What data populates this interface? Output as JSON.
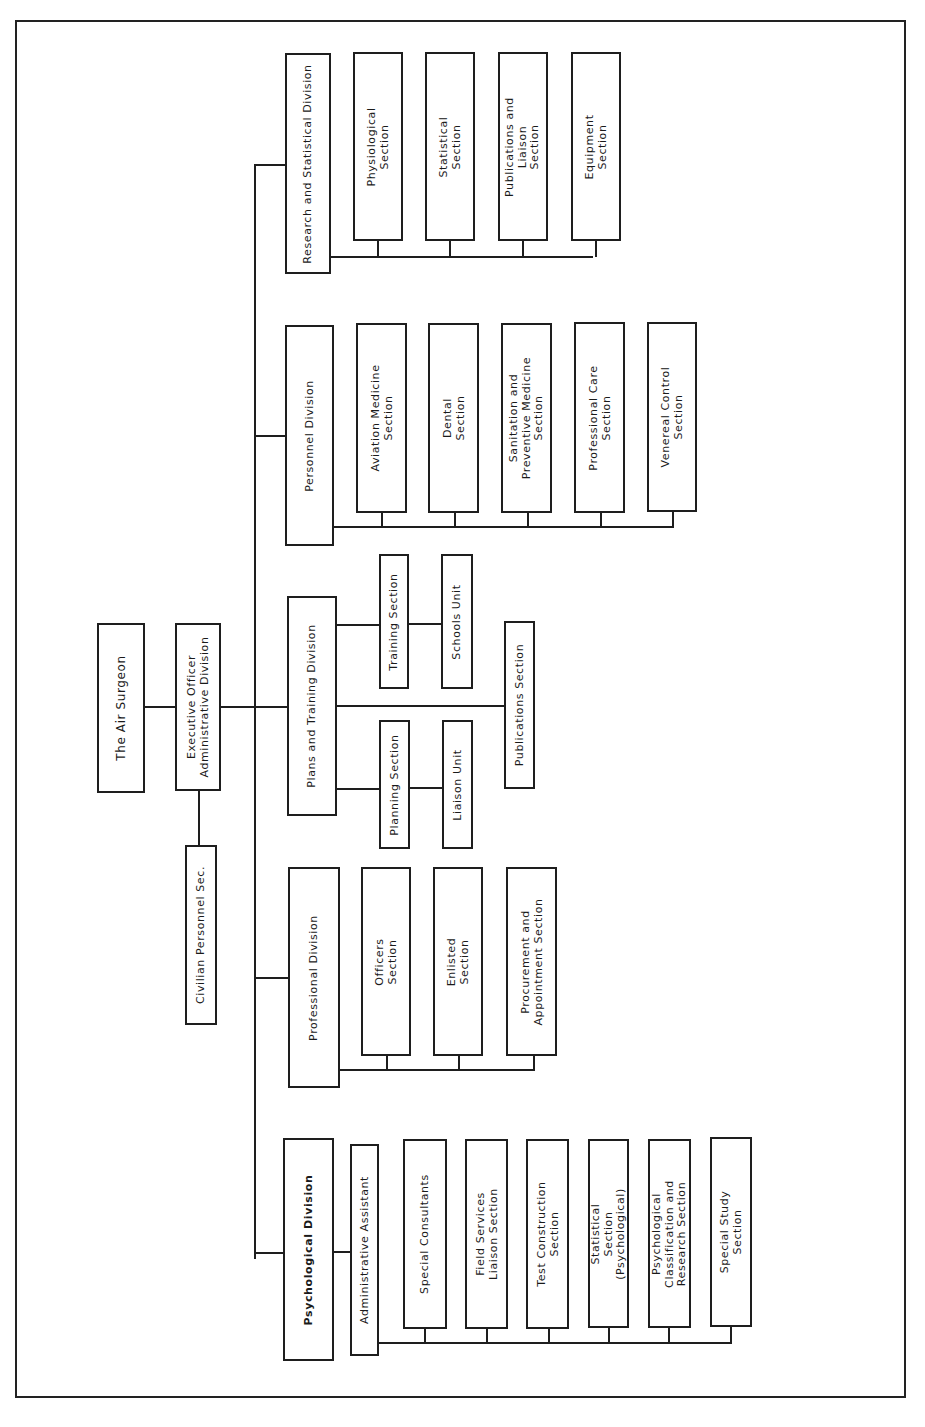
{
  "chart": {
    "orientation": "rotated 90 degrees counter-clockwise",
    "root": {
      "label": "The Air Surgeon",
      "executive": "Executive Officer\nAdministrative Division",
      "staff": "Civilian Personnel Sec."
    },
    "divisions": [
      {
        "label": "Research and Statistical Division",
        "sections": [
          "Physiological\nSection",
          "Statistical\nSection",
          "Publications and\nLiaison\nSection",
          "Equipment\nSection"
        ]
      },
      {
        "label": "Personnel Division",
        "sections": [
          "Aviation Medicine\nSection",
          "Dental\nSection",
          "Sanitation and\nPreventive Medicine\nSection",
          "Professional Care\nSection",
          "Venereal Control\nSection"
        ]
      },
      {
        "label": "Plans and Training Division",
        "training_branch": {
          "section": "Training Section",
          "unit": "Schools Unit"
        },
        "publications": "Publications Section",
        "planning_branch": {
          "section": "Planning Section",
          "unit": "Liaison Unit"
        }
      },
      {
        "label": "Professional Division",
        "sections": [
          "Officers\nSection",
          "Enlisted\nSection",
          "Procurement and\nAppointment Section"
        ]
      },
      {
        "label": "Psychological Division",
        "assistant": "Administrative Assistant",
        "sections": [
          "Special Consultants",
          "Field Services\nLiaison Section",
          "Test Construction\nSection",
          "Statistical\nSection\n(Psychological)",
          "Psychological\nClassification and\nResearch Section",
          "Special Study\nSection"
        ]
      }
    ]
  }
}
